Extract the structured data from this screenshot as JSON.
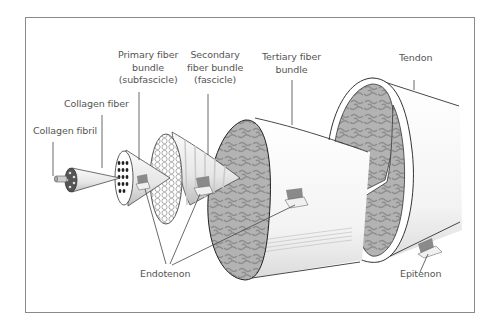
{
  "diagram": {
    "labels": {
      "collagen_fibril": "Collagen fibril",
      "collagen_fiber": "Collagen fiber",
      "primary_bundle": "Primary fiber\nbundle\n(subfascicle)",
      "secondary_bundle": "Secondary\nfiber bundle\n(fascicle)",
      "tertiary_bundle": "Tertiary fiber\nbundle",
      "tendon": "Tendon",
      "endotenon": "Endotenon",
      "epitenon": "Epitenon"
    },
    "colors": {
      "frame": "#8a8a8a",
      "text": "#555555",
      "tissue_fill": "#a9a9a9",
      "outline": "#333333"
    }
  }
}
